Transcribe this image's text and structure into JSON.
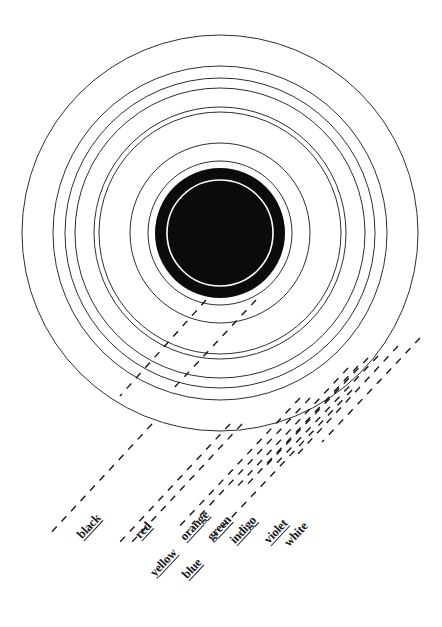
{
  "figure": {
    "background_color": "#ffffff",
    "ink_color": "#17171c",
    "center": {
      "x": 220,
      "y": 233
    }
  },
  "core": {
    "name": "central black disc",
    "fill_color": "#0b0b0d",
    "outer_radius": 65,
    "inner_white_ring_radius": 53,
    "inner_white_ring_width": 1.6
  },
  "rings": [
    {
      "id": "ring-1",
      "label": "white",
      "radius": 198,
      "stroke_width": 0.9
    },
    {
      "id": "ring-2",
      "label": "violet",
      "radius": 167,
      "stroke_width": 0.9
    },
    {
      "id": "ring-3",
      "label": "indigo",
      "radius": 155,
      "stroke_width": 0.9
    },
    {
      "id": "ring-4",
      "label": "blue",
      "radius": 145,
      "stroke_width": 0.9
    },
    {
      "id": "ring-5",
      "label": "green",
      "radius": 126,
      "stroke_width": 0.9
    },
    {
      "id": "ring-6",
      "label": "orange",
      "radius": 121,
      "stroke_width": 0.9
    },
    {
      "id": "ring-7",
      "label": "yellow",
      "radius": 90,
      "stroke_width": 0.9
    },
    {
      "id": "ring-8",
      "label": "red",
      "radius": 72,
      "stroke_width": 0.9
    },
    {
      "id": "ring-9",
      "label": "black",
      "radius": 65,
      "stroke_width": 0.9
    }
  ],
  "labels": [
    {
      "id": "label-black",
      "text": "black",
      "x": 85,
      "y": 540,
      "rotation_deg": -47,
      "underlined": true
    },
    {
      "id": "label-red",
      "text": "red",
      "x": 143,
      "y": 540,
      "rotation_deg": -47,
      "underlined": true
    },
    {
      "id": "label-yellow",
      "text": "yellow",
      "x": 158,
      "y": 578,
      "rotation_deg": -47,
      "underlined": true
    },
    {
      "id": "label-orange",
      "text": "orange",
      "x": 188,
      "y": 542,
      "rotation_deg": -47,
      "underlined": true
    },
    {
      "id": "label-blue",
      "text": "blue",
      "x": 190,
      "y": 580,
      "rotation_deg": -47,
      "underlined": true
    },
    {
      "id": "label-green",
      "text": "green",
      "x": 215,
      "y": 542,
      "rotation_deg": -47,
      "underlined": true
    },
    {
      "id": "label-indigo",
      "text": "indigo",
      "x": 238,
      "y": 545,
      "rotation_deg": -47,
      "underlined": true
    },
    {
      "id": "label-violet",
      "text": "violet",
      "x": 272,
      "y": 545,
      "rotation_deg": -47,
      "underlined": true
    },
    {
      "id": "label-white",
      "text": "white",
      "x": 292,
      "y": 548,
      "rotation_deg": -47,
      "underlined": false
    }
  ],
  "leaders": {
    "style": "dashed",
    "dash_pattern": "7 7",
    "stroke_width": 1.4,
    "angle_deg": 47,
    "lines": [
      {
        "id": "leader-black-a",
        "x1": 152,
        "y1": 424,
        "x2": 48,
        "y2": 536
      },
      {
        "id": "leader-black-b",
        "x1": 206,
        "y1": 300,
        "x2": 120,
        "y2": 396
      },
      {
        "id": "leader-red-a",
        "x1": 230,
        "y1": 424,
        "x2": 120,
        "y2": 542
      },
      {
        "id": "leader-red-b",
        "x1": 242,
        "y1": 424,
        "x2": 132,
        "y2": 542
      },
      {
        "id": "leader-yellow",
        "x1": 300,
        "y1": 398,
        "x2": 176,
        "y2": 530
      },
      {
        "id": "leader-orange-a",
        "x1": 310,
        "y1": 398,
        "x2": 192,
        "y2": 524
      },
      {
        "id": "leader-orange-b",
        "x1": 256,
        "y1": 300,
        "x2": 172,
        "y2": 390
      },
      {
        "id": "leader-blue",
        "x1": 352,
        "y1": 390,
        "x2": 214,
        "y2": 536
      },
      {
        "id": "leader-green-a",
        "x1": 348,
        "y1": 368,
        "x2": 234,
        "y2": 490
      },
      {
        "id": "leader-green-b",
        "x1": 358,
        "y1": 366,
        "x2": 244,
        "y2": 488
      },
      {
        "id": "leader-indigo-a",
        "x1": 368,
        "y1": 358,
        "x2": 262,
        "y2": 470
      },
      {
        "id": "leader-indigo-b",
        "x1": 378,
        "y1": 356,
        "x2": 272,
        "y2": 468
      },
      {
        "id": "leader-violet",
        "x1": 398,
        "y1": 346,
        "x2": 296,
        "y2": 456
      },
      {
        "id": "leader-white",
        "x1": 420,
        "y1": 338,
        "x2": 322,
        "y2": 442
      }
    ]
  }
}
